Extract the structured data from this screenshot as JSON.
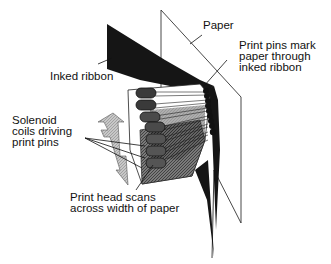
{
  "diagram": {
    "type": "dot-matrix printer mechanism",
    "labels": {
      "paper": "Paper",
      "print_pins_mark": [
        "Print pins mark",
        "paper through",
        "inked ribbon"
      ],
      "inked_ribbon": "Inked ribbon",
      "solenoid": [
        "Solenoid",
        "coils driving",
        "print pins"
      ],
      "print_head_scans": [
        "Print head scans",
        "across width of paper"
      ]
    },
    "colors": {
      "ink": "#111111",
      "ribbon": "#151515",
      "coil_dark": "#3a3a3a",
      "coil_mid": "#555555",
      "head_gray": "#8a8a8a",
      "arrow_fill": "#bdbdbd",
      "paper_line": "#333333",
      "background": "#ffffff"
    }
  }
}
